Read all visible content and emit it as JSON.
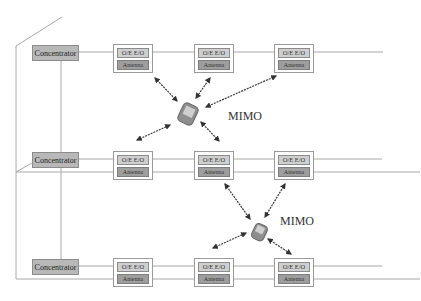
{
  "diagram": {
    "type": "distributed antenna system with MIMO",
    "concentrator_label": "Concentrator",
    "unit_top_label": "O/E  E/O",
    "unit_bottom_label": "Antenna",
    "rows": [
      {
        "concentrator": {
          "label": "Concentrator"
        },
        "units": [
          {
            "oe": "O/E  E/O",
            "antenna": "Antenna"
          },
          {
            "oe": "O/E  E/O",
            "antenna": "Antenna"
          },
          {
            "oe": "O/E  E/O",
            "antenna": "Antenna"
          }
        ]
      },
      {
        "concentrator": {
          "label": "Concentrator"
        },
        "units": [
          {
            "oe": "O/E  E/O",
            "antenna": "Antenna"
          },
          {
            "oe": "O/E  E/O",
            "antenna": "Antenna"
          },
          {
            "oe": "O/E  E/O",
            "antenna": "Antenna"
          }
        ]
      },
      {
        "concentrator": {
          "label": "Concentrator"
        },
        "units": [
          {
            "oe": "O/E  E/O",
            "antenna": "Antenna"
          },
          {
            "oe": "O/E  E/O",
            "antenna": "Antenna"
          },
          {
            "oe": "O/E  E/O",
            "antenna": "Antenna"
          }
        ]
      }
    ],
    "mimo_groups": [
      {
        "label": "MIMO",
        "device": "mobile-phone",
        "links": 5
      },
      {
        "label": "MIMO",
        "device": "mobile-phone",
        "links": 4
      }
    ],
    "colors": {
      "concentrator_fill": "#b8b8b8",
      "oe_fill": "#cfcfcf",
      "antenna_fill": "#9e9e9e",
      "line": "#a8a8a8",
      "arrow": "#333333"
    }
  }
}
